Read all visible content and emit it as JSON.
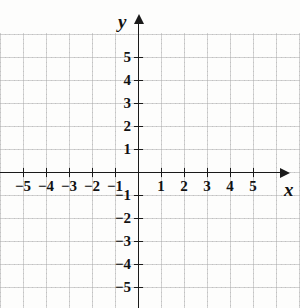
{
  "figure": {
    "kind": "cartesian-coordinate-plane",
    "background_color": "#fdfdfc",
    "axis_color": "#1a1a1a",
    "grid_color": "#aaaaaa",
    "label_color": "#111111",
    "origin_px": {
      "x": 138,
      "y": 172
    },
    "unit_px": 23
  },
  "axes": {
    "x": {
      "name": "x",
      "has_arrow_positive": true,
      "has_arrow_negative": false,
      "tick_values": [
        -5,
        -4,
        -3,
        -2,
        -1,
        1,
        2,
        3,
        4,
        5
      ],
      "tick_labels": [
        "−5",
        "−4",
        "−3",
        "−2",
        "−1",
        "1",
        "2",
        "3",
        "4",
        "5"
      ]
    },
    "y": {
      "name": "y",
      "has_arrow_positive": true,
      "has_arrow_negative": false,
      "tick_values": [
        5,
        4,
        3,
        2,
        1,
        -1,
        -2,
        -3,
        -4,
        -5
      ],
      "tick_labels": [
        "5",
        "4",
        "3",
        "2",
        "1",
        "−1",
        "−2",
        "−3",
        "−4",
        "−5"
      ]
    }
  },
  "artifacts": {
    "top_clipped_glyph": "y"
  },
  "chart_data": {
    "type": "scatter",
    "title": "",
    "xlabel": "x",
    "ylabel": "y",
    "xlim": [
      -6,
      6
    ],
    "ylim": [
      -6,
      6
    ],
    "xticks": [
      -5,
      -4,
      -3,
      -2,
      -1,
      1,
      2,
      3,
      4,
      5
    ],
    "yticks": [
      -5,
      -4,
      -3,
      -2,
      -1,
      1,
      2,
      3,
      4,
      5
    ],
    "grid": true,
    "legend": null,
    "series": []
  }
}
